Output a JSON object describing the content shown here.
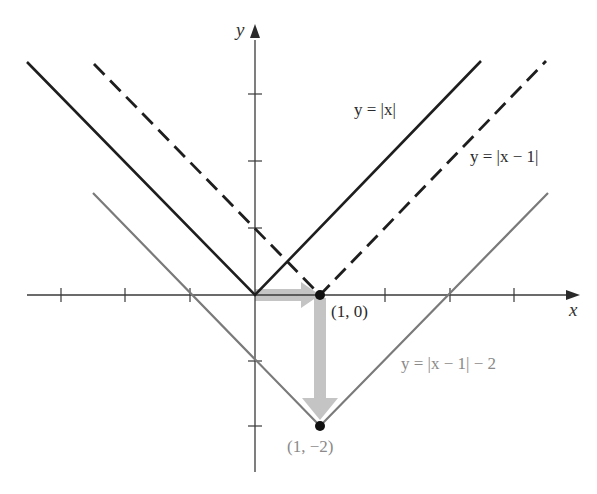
{
  "figure": {
    "type": "function-translation-graph",
    "axes": {
      "x_label": "x",
      "y_label": "y",
      "origin_px": [
        255,
        295
      ],
      "unit_px": 65,
      "x_ticks": [
        -3,
        -2,
        -1,
        1,
        2,
        3,
        4
      ],
      "y_ticks": [
        -2,
        -1,
        1,
        2,
        3
      ]
    },
    "curves": [
      {
        "name": "y = |x|",
        "label": "y = |x|",
        "style": "solid",
        "color": "#1e1e1e",
        "vertex": [
          0,
          0
        ],
        "shift_x": 0,
        "shift_y": 0
      },
      {
        "name": "y = |x − 1|",
        "label": "y = |x − 1|",
        "style": "dashed",
        "color": "#1e1e1e",
        "vertex": [
          1,
          0
        ],
        "shift_x": 1,
        "shift_y": 0
      },
      {
        "name": "y = |x − 1| − 2",
        "label": "y = |x − 1| − 2",
        "style": "solid",
        "color": "#7a7a7a",
        "vertex": [
          1,
          -2
        ],
        "shift_x": 1,
        "shift_y": -2
      }
    ],
    "points": [
      {
        "label": "(1, 0)",
        "x": 1,
        "y": 0
      },
      {
        "label": "(1, −2)",
        "x": 1,
        "y": -2
      }
    ],
    "arrows": [
      {
        "from": [
          0,
          0
        ],
        "to": [
          1,
          0
        ],
        "meaning": "shift right 1",
        "color": "#c4c4c4"
      },
      {
        "from": [
          1,
          0
        ],
        "to": [
          1,
          -2
        ],
        "meaning": "shift down 2",
        "color": "#c4c4c4"
      }
    ]
  },
  "labels": {
    "x_axis": "x",
    "y_axis": "y",
    "eq_abs_x": "y = |x|",
    "eq_abs_x_minus_1": "y = |x − 1|",
    "eq_abs_x_minus_1_minus_2": "y = |x − 1| − 2",
    "point_1_0": "(1, 0)",
    "point_1_neg2": "(1, −2)"
  },
  "colors": {
    "axis": "#3a3a3a",
    "primary_line": "#1e1e1e",
    "shifted_line": "#7a7a7a",
    "arrow_fill": "#c4c4c4",
    "point": "#111111"
  }
}
